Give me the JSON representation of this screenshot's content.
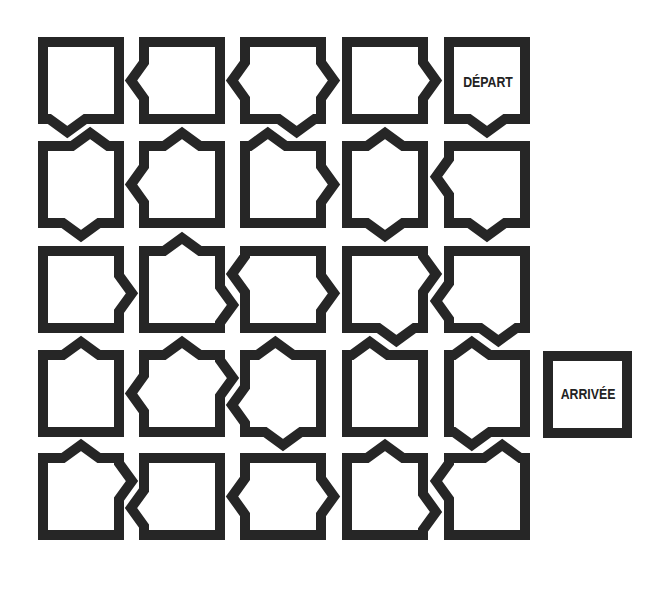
{
  "puzzle": {
    "grid": {
      "rows": 5,
      "cols": 5
    },
    "start_label": "DÉPART",
    "end_label": "ARRIVÉE",
    "start_cell": {
      "row": 1,
      "col": 5
    },
    "ink_color": "#262626",
    "background_color": "#ffffff",
    "cells": [
      {
        "row": 1,
        "col": 1,
        "arrows": [
          {
            "side": "bottom",
            "pos": 0.32
          }
        ]
      },
      {
        "row": 1,
        "col": 2,
        "arrows": [
          {
            "side": "left",
            "pos": 0.5
          }
        ]
      },
      {
        "row": 1,
        "col": 3,
        "arrows": [
          {
            "side": "left",
            "pos": 0.5
          },
          {
            "side": "right",
            "pos": 0.5
          },
          {
            "side": "bottom",
            "pos": 0.68
          }
        ]
      },
      {
        "row": 1,
        "col": 4,
        "arrows": [
          {
            "side": "right",
            "pos": 0.5
          }
        ]
      },
      {
        "row": 1,
        "col": 5,
        "label": "DÉPART",
        "arrows": [
          {
            "side": "bottom",
            "pos": 0.5
          }
        ]
      },
      {
        "row": 2,
        "col": 1,
        "arrows": [
          {
            "side": "top",
            "pos": 0.62
          },
          {
            "side": "bottom",
            "pos": 0.5
          }
        ]
      },
      {
        "row": 2,
        "col": 2,
        "arrows": [
          {
            "side": "left",
            "pos": 0.5
          },
          {
            "side": "top",
            "pos": 0.5
          }
        ]
      },
      {
        "row": 2,
        "col": 3,
        "arrows": [
          {
            "side": "top",
            "pos": 0.3
          },
          {
            "side": "right",
            "pos": 0.5
          }
        ]
      },
      {
        "row": 2,
        "col": 4,
        "arrows": [
          {
            "side": "top",
            "pos": 0.5
          },
          {
            "side": "bottom",
            "pos": 0.5
          }
        ]
      },
      {
        "row": 2,
        "col": 5,
        "arrows": [
          {
            "side": "left",
            "pos": 0.4
          },
          {
            "side": "bottom",
            "pos": 0.5
          }
        ]
      },
      {
        "row": 3,
        "col": 1,
        "arrows": [
          {
            "side": "right",
            "pos": 0.55
          }
        ]
      },
      {
        "row": 3,
        "col": 2,
        "arrows": [
          {
            "side": "top",
            "pos": 0.5
          },
          {
            "side": "right",
            "pos": 0.7
          }
        ]
      },
      {
        "row": 3,
        "col": 3,
        "arrows": [
          {
            "side": "left",
            "pos": 0.3
          },
          {
            "side": "right",
            "pos": 0.55
          }
        ]
      },
      {
        "row": 3,
        "col": 4,
        "arrows": [
          {
            "side": "right",
            "pos": 0.3
          },
          {
            "side": "bottom",
            "pos": 0.65
          }
        ]
      },
      {
        "row": 3,
        "col": 5,
        "arrows": [
          {
            "side": "left",
            "pos": 0.65
          },
          {
            "side": "bottom",
            "pos": 0.65
          }
        ]
      },
      {
        "row": 4,
        "col": 1,
        "arrows": [
          {
            "side": "top",
            "pos": 0.5
          }
        ]
      },
      {
        "row": 4,
        "col": 2,
        "arrows": [
          {
            "side": "top",
            "pos": 0.5
          },
          {
            "side": "left",
            "pos": 0.5
          },
          {
            "side": "right",
            "pos": 0.3
          }
        ]
      },
      {
        "row": 4,
        "col": 3,
        "arrows": [
          {
            "side": "top",
            "pos": 0.4
          },
          {
            "side": "left",
            "pos": 0.65
          },
          {
            "side": "bottom",
            "pos": 0.5
          }
        ]
      },
      {
        "row": 4,
        "col": 4,
        "arrows": [
          {
            "side": "top",
            "pos": 0.3
          }
        ]
      },
      {
        "row": 4,
        "col": 5,
        "arrows": [
          {
            "side": "top",
            "pos": 0.3
          },
          {
            "side": "bottom",
            "pos": 0.3
          }
        ]
      },
      {
        "row": 5,
        "col": 1,
        "arrows": [
          {
            "side": "top",
            "pos": 0.5
          },
          {
            "side": "right",
            "pos": 0.3
          }
        ]
      },
      {
        "row": 5,
        "col": 2,
        "arrows": [
          {
            "side": "left",
            "pos": 0.65
          }
        ]
      },
      {
        "row": 5,
        "col": 3,
        "arrows": [
          {
            "side": "left",
            "pos": 0.5
          },
          {
            "side": "right",
            "pos": 0.5
          }
        ]
      },
      {
        "row": 5,
        "col": 4,
        "arrows": [
          {
            "side": "top",
            "pos": 0.5
          },
          {
            "side": "right",
            "pos": 0.7
          }
        ]
      },
      {
        "row": 5,
        "col": 5,
        "arrows": [
          {
            "side": "left",
            "pos": 0.3
          },
          {
            "side": "top",
            "pos": 0.7
          }
        ]
      }
    ]
  }
}
